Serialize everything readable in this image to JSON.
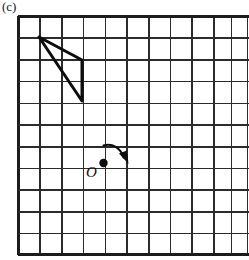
{
  "figure": {
    "label": "(c)",
    "background_color": "#ffffff",
    "ink_color": "#0d0d0d",
    "grid_color": "#2b2b2b"
  },
  "grid": {
    "columns": 11,
    "rows": 11,
    "cell_size_px": 21.7,
    "origin_x_px": 18,
    "origin_y_px": 16,
    "right_edge_clipped": true,
    "line_color": "#2b2b2b",
    "border_color": "#1c1c1c"
  },
  "triangle": {
    "name": "shaded-triangle",
    "vertices": [
      {
        "label": "A",
        "x": 39,
        "y": 37,
        "grid_col": 1,
        "grid_row": 1
      },
      {
        "label": "B",
        "x": 82,
        "y": 60,
        "grid_col": 3,
        "grid_row": 2
      },
      {
        "label": "C",
        "x": 82,
        "y": 101,
        "grid_col": 3,
        "grid_row": 4
      }
    ],
    "stroke_color": "#0d0d0d",
    "stroke_width": 3.0,
    "fill": "none"
  },
  "origin_marker": {
    "label": "O",
    "dot_x": 103,
    "dot_y": 163,
    "dot_radius": 4.2,
    "grid_col": 4,
    "grid_row": 7,
    "label_x": 86,
    "label_y": 165,
    "color": "#0d0d0d"
  },
  "rotation_arrow": {
    "name": "rotation-arc-arrow",
    "start_x": 103,
    "start_y": 145,
    "end_x": 124,
    "end_y": 161,
    "direction": "clockwise",
    "arrow_head_size": 8,
    "color": "#0d0d0d"
  }
}
